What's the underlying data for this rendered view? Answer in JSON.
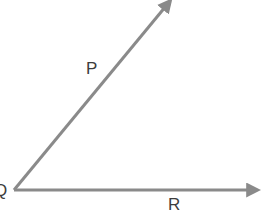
{
  "diagram": {
    "background_color": "#ffffff",
    "stroke_color": "#8a8a8a",
    "label_color": "#3d3d3d",
    "stroke_width": 3,
    "width": 266,
    "height": 223,
    "vertex": {
      "name": "Q",
      "label": "Q",
      "x": 14,
      "y": 190
    },
    "rays": [
      {
        "name": "ray-QP",
        "label": "P",
        "from_x": 14,
        "from_y": 190,
        "to_x": 168,
        "to_y": 4,
        "arrowhead": true,
        "label_x": 90,
        "label_y": 67
      },
      {
        "name": "ray-QR",
        "label": "R",
        "from_x": 14,
        "from_y": 190,
        "to_x": 258,
        "to_y": 190,
        "arrowhead": true,
        "label_x": 172,
        "label_y": 203
      }
    ]
  },
  "labels": {
    "vertex_q": "Q",
    "ray_p": "P",
    "ray_r": "R"
  }
}
